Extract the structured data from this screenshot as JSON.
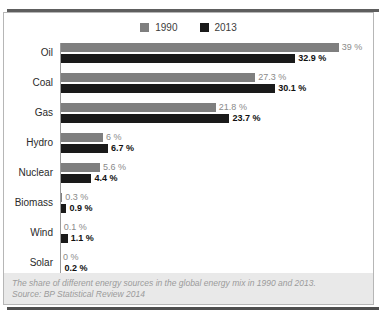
{
  "chart_data": {
    "type": "bar",
    "orientation": "horizontal",
    "categories": [
      "Oil",
      "Coal",
      "Gas",
      "Hydro",
      "Nuclear",
      "Biomass",
      "Wind",
      "Solar"
    ],
    "series": [
      {
        "name": "1990",
        "color": "#7f7f7f",
        "values": [
          39,
          27.3,
          21.8,
          6,
          5.6,
          0.3,
          0.1,
          0
        ],
        "labels": [
          "39 %",
          "27.3 %",
          "21.8 %",
          "6 %",
          "5.6 %",
          "0.3 %",
          "0.1 %",
          "0 %"
        ]
      },
      {
        "name": "2013",
        "color": "#1a1a1a",
        "values": [
          32.9,
          30.1,
          23.7,
          6.7,
          4.4,
          0.9,
          1.1,
          0.2
        ],
        "labels": [
          "32.9 %",
          "30.1 %",
          "23.7 %",
          "6.7 %",
          "4.4 %",
          "0.9 %",
          "1.1 %",
          "0.2 %"
        ]
      }
    ],
    "xlim": [
      0,
      40
    ],
    "value_suffix": " %",
    "legend_position": "top",
    "grid": false,
    "axis_color": "#9a9a9a"
  },
  "caption": {
    "line1": "The share of different energy sources in the global energy mix in 1990 and 2013.",
    "line2": "Source: BP Statistical Review 2014"
  }
}
